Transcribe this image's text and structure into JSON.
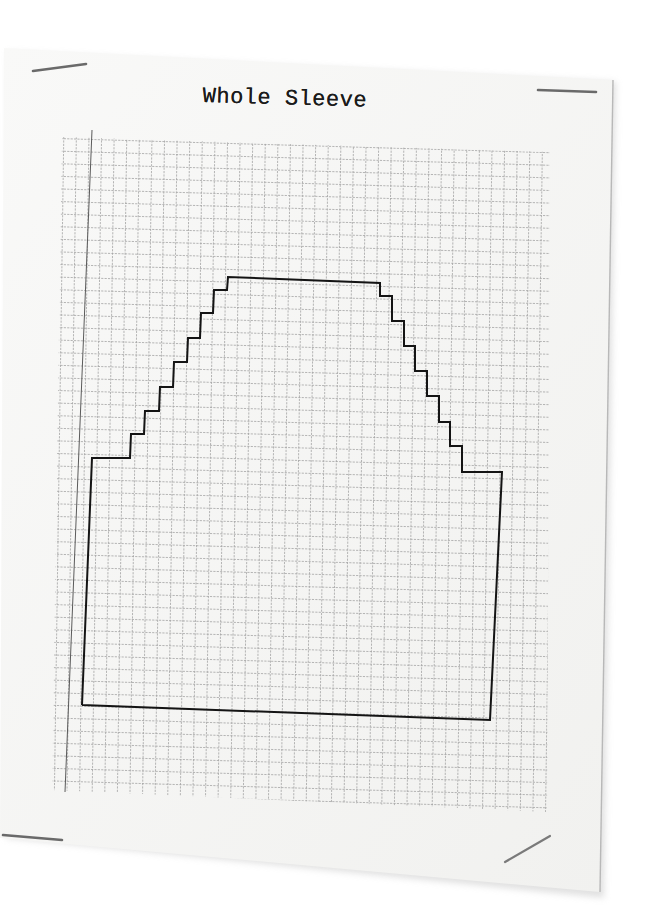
{
  "document": {
    "title": "Whole Sleeve",
    "type": "knitting sleeve schematic on graph paper"
  },
  "colors": {
    "background": "#ffffff",
    "paper": "#f7f7f5",
    "grid_line": "#9a9a9a",
    "margin_line": "#555555",
    "outline": "#141414",
    "staple": "#6e6e6e"
  },
  "grid": {
    "cell_px": 12.6,
    "columns": 39,
    "rows": 52
  },
  "sleeve_outline": {
    "description": "Sleeve cap with stepped decreases on both sides, rectangular lower body",
    "left_steps": 8,
    "right_steps": 8
  }
}
